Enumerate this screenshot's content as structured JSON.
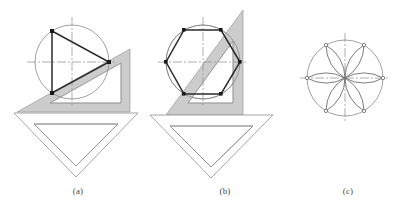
{
  "figure": {
    "kind": "technical-drawing-illustration",
    "background_color": "#ffffff",
    "canvas": {
      "width": 394,
      "height": 215
    }
  },
  "style": {
    "shaded_setsquare_fill": "#cccccc",
    "shaded_setsquare_stroke": "#9a9a9a",
    "clear_setsquare_fill": "#ffffff",
    "clear_setsquare_stroke": "#8f8f8f",
    "construction_line_color": "#8a8a8a",
    "centerline_color": "#8a8a8a",
    "object_line_color": "#2b2b2b",
    "vertex_marker_color": "#1a1a1a",
    "caption_color": "#4a4a4a",
    "centerline_dash": "9 2 2 2"
  },
  "panels": [
    {
      "id": "a",
      "caption": "(a)",
      "subject": "equilateral-triangle-inscribed-in-circle",
      "circle": {
        "cx": 72,
        "cy": 62,
        "r": 37
      },
      "centerlines": {
        "horizontal": {
          "x1": 27,
          "y1": 62,
          "x2": 117,
          "y2": 62
        },
        "vertical": {
          "x1": 72,
          "y1": 17,
          "x2": 72,
          "y2": 107
        }
      },
      "polygon": {
        "type": "triangle",
        "sides": 3,
        "vertices": [
          {
            "x": 52,
            "y": 31
          },
          {
            "x": 109,
            "y": 62
          },
          {
            "x": 52,
            "y": 93
          }
        ]
      },
      "shaded_setsquare": {
        "type": "30-60-90",
        "outer": [
          {
            "x": 17,
            "y": 112
          },
          {
            "x": 130,
            "y": 49
          },
          {
            "x": 130,
            "y": 112
          }
        ],
        "inner": [
          {
            "x": 50,
            "y": 103
          },
          {
            "x": 121,
            "y": 63
          },
          {
            "x": 121,
            "y": 103
          }
        ]
      },
      "clear_setsquare": {
        "type": "45-45-90",
        "outer": [
          {
            "x": 14,
            "y": 113
          },
          {
            "x": 138,
            "y": 113
          },
          {
            "x": 76,
            "y": 177
          }
        ],
        "inner": [
          {
            "x": 34,
            "y": 124
          },
          {
            "x": 118,
            "y": 124
          },
          {
            "x": 76,
            "y": 166
          }
        ]
      }
    },
    {
      "id": "b",
      "caption": "(b)",
      "subject": "regular-hexagon-inscribed-in-circle",
      "circle": {
        "cx": 203,
        "cy": 62,
        "r": 37
      },
      "centerlines": {
        "horizontal": {
          "x1": 158,
          "y1": 62,
          "x2": 248,
          "y2": 62
        },
        "vertical": {
          "x1": 203,
          "y1": 17,
          "x2": 203,
          "y2": 107
        }
      },
      "polygon": {
        "type": "hexagon",
        "sides": 6,
        "vertices": [
          {
            "x": 240,
            "y": 62
          },
          {
            "x": 221,
            "y": 30
          },
          {
            "x": 184,
            "y": 30
          },
          {
            "x": 166,
            "y": 62
          },
          {
            "x": 184,
            "y": 94
          },
          {
            "x": 221,
            "y": 94
          }
        ]
      },
      "shaded_setsquare": {
        "type": "30-60-90-steep",
        "outer": [
          {
            "x": 166,
            "y": 115
          },
          {
            "x": 243,
            "y": 10
          },
          {
            "x": 243,
            "y": 115
          }
        ],
        "inner": [
          {
            "x": 188,
            "y": 103
          },
          {
            "x": 233,
            "y": 41
          },
          {
            "x": 233,
            "y": 103
          }
        ]
      },
      "clear_setsquare": {
        "type": "45-45-90",
        "outer": [
          {
            "x": 150,
            "y": 115
          },
          {
            "x": 273,
            "y": 115
          },
          {
            "x": 211,
            "y": 178
          }
        ],
        "inner": [
          {
            "x": 170,
            "y": 126
          },
          {
            "x": 253,
            "y": 126
          },
          {
            "x": 211,
            "y": 167
          }
        ]
      }
    },
    {
      "id": "c",
      "caption": "(c)",
      "subject": "six-petal-rosette-in-circle",
      "circle": {
        "cx": 345,
        "cy": 78,
        "r": 38
      },
      "centerlines": {
        "horizontal": {
          "x1": 300,
          "y1": 78,
          "x2": 390,
          "y2": 78
        },
        "vertical": {
          "x1": 345,
          "y1": 33,
          "x2": 345,
          "y2": 123
        }
      },
      "petal_count": 6,
      "marker_radius": 1.6,
      "markers": [
        {
          "x": 383,
          "y": 78
        },
        {
          "x": 364,
          "y": 45
        },
        {
          "x": 326,
          "y": 45
        },
        {
          "x": 307,
          "y": 78
        },
        {
          "x": 326,
          "y": 111
        },
        {
          "x": 364,
          "y": 111
        }
      ]
    }
  ]
}
